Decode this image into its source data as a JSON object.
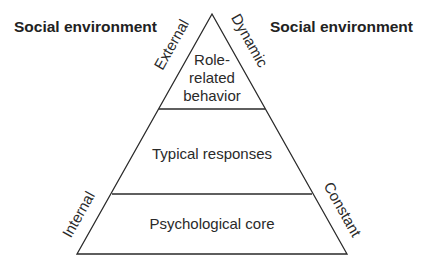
{
  "headings": {
    "left": "Social environment",
    "right": "Social environment"
  },
  "pyramid": {
    "levels": [
      {
        "lines": [
          "Role-",
          "related",
          "behavior"
        ]
      },
      {
        "lines": [
          "Typical responses"
        ]
      },
      {
        "lines": [
          "Psychological core"
        ]
      }
    ],
    "side_labels": {
      "upper_left": "External",
      "upper_right": "Dynamic",
      "lower_left": "Internal",
      "lower_right": "Constant"
    }
  },
  "colors": {
    "line": "#2a2a2a",
    "text": "#2a2a2a",
    "background": "#ffffff"
  }
}
